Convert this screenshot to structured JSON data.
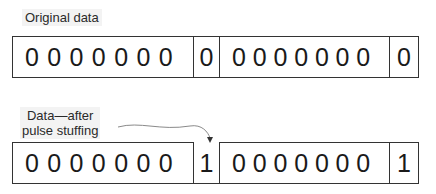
{
  "labels": {
    "original": "Original data",
    "after_line1": "Data—after",
    "after_line2": "pulse stuffing"
  },
  "rows": {
    "original": {
      "cells": [
        {
          "bits": [
            "0",
            "0",
            "0",
            "0",
            "0",
            "0",
            "0"
          ]
        },
        {
          "bits": [
            "0"
          ]
        },
        {
          "bits": [
            "0",
            "0",
            "0",
            "0",
            "0",
            "0",
            "0"
          ]
        },
        {
          "bits": [
            "0"
          ]
        }
      ]
    },
    "stuffed": {
      "cells": [
        {
          "bits": [
            "0",
            "0",
            "0",
            "0",
            "0",
            "0",
            "0"
          ]
        },
        {
          "bits": [
            "1"
          ]
        },
        {
          "bits": [
            "0",
            "0",
            "0",
            "0",
            "0",
            "0",
            "0"
          ]
        },
        {
          "bits": [
            "1"
          ]
        }
      ]
    }
  },
  "colors": {
    "stroke": "#333333",
    "arrow": "#8a8a8a",
    "label_bg": "#f3f3f3"
  }
}
